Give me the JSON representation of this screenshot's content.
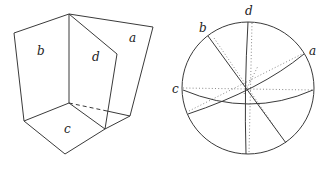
{
  "left_figure": {
    "description": "Polyhedral wedge with four planar faces",
    "labels": {
      "a": "a",
      "b": "b",
      "c": "c",
      "d": "d"
    }
  },
  "right_figure": {
    "description": "Stereographic projection of the four planes on a circle",
    "labels": {
      "a": "a",
      "b": "b",
      "c": "c",
      "d": "d"
    }
  },
  "colors": {
    "line": "#3a3a3a",
    "dotted": "#8a8a8a",
    "background": "#ffffff"
  }
}
